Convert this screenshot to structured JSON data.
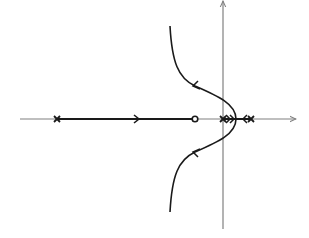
{
  "diagram": {
    "type": "root-locus",
    "title": "",
    "colors": {
      "background": "#ffffff",
      "axis": "#808080",
      "locus": "#1a1a1a"
    },
    "axes": {
      "real_axis": {
        "x1": 20,
        "x2": 296,
        "y": 119,
        "arrow": "right"
      },
      "imag_axis": {
        "x": 223,
        "y1": 229,
        "y2": 1,
        "arrow": "up"
      }
    },
    "poles": [
      {
        "id": "pole-1",
        "x": 57,
        "y": 119,
        "marker": "x"
      },
      {
        "id": "pole-2-origin",
        "x": 223,
        "y": 119,
        "marker": "x"
      },
      {
        "id": "pole-3",
        "x": 251,
        "y": 119,
        "marker": "x"
      }
    ],
    "zeros": [
      {
        "id": "zero-1",
        "x": 195,
        "y": 119,
        "marker": "o"
      }
    ],
    "branches": [
      {
        "id": "real-branch-left",
        "from": [
          57,
          119
        ],
        "to": [
          195,
          119
        ],
        "arrow_at": [
          138,
          119
        ],
        "direction": "right"
      },
      {
        "id": "real-branch-origin",
        "from": [
          223,
          119
        ],
        "to": [
          236,
          119
        ],
        "arrow_at": [
          231,
          119
        ],
        "direction": "right"
      },
      {
        "id": "real-branch-right",
        "from": [
          251,
          119
        ],
        "to": [
          236,
          119
        ],
        "arrow_at": [
          244,
          119
        ],
        "direction": "left"
      },
      {
        "id": "complex-branch-upper",
        "path": "M236,119 C236,104 218,96 195,86 C178,78 172,62 170,26",
        "arrow_at": [
          195,
          86
        ],
        "direction": "up-left"
      },
      {
        "id": "complex-branch-lower",
        "path": "M236,119 C236,134 218,142 195,152 C178,160 172,176 170,212",
        "arrow_at": [
          195,
          152
        ],
        "direction": "down-left"
      }
    ],
    "breakaway_point": {
      "x": 236,
      "y": 119
    }
  }
}
